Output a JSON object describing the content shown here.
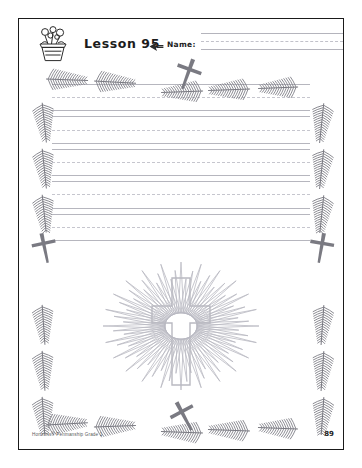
{
  "page": {
    "lesson_label": "Lesson 95",
    "name_label": "Name:",
    "footer_credit": "Horizons® Penmanship Grade 1",
    "page_number": "89"
  },
  "icons": {
    "flower_pot": "flower-pot-icon",
    "pointer": "pointer-arrow-icon",
    "cross_illustration": "cross-sunburst-illustration",
    "branch": "palm-branch-icon",
    "border_cross": "cross-icon"
  },
  "writing": {
    "line_group_count": 5,
    "name_line_count": 1
  },
  "colors": {
    "page_background": "#ffffff",
    "frame": "#1a1a1a",
    "rule_solid": "#b6b6be",
    "rule_dashed": "#c6c6ce",
    "decoration": "#7a7a82",
    "illustration_stroke": "#b9b9c1",
    "text": "#1c1c1c",
    "footer_text": "#5a5a5a"
  }
}
